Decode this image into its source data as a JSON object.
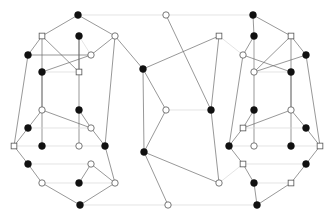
{
  "figure": {
    "type": "node-link-diagram",
    "width": 333,
    "height": 219,
    "background_color": "#ffffff",
    "edge_color_dark": "#6b6b6b",
    "edge_color_light": "#d8d8d8",
    "node_fill_black": "#111111",
    "node_fill_white": "#ffffff",
    "node_stroke": "#555555"
  },
  "legend": {
    "black_node_label": "filled vertex",
    "white_node_label": "hollow vertex",
    "square_node_label": "hollow square vertex"
  },
  "nodes": [
    {
      "id": "t1",
      "x": 78,
      "y": 15,
      "style": "black",
      "shape": "circle",
      "r": 3.4
    },
    {
      "id": "t2",
      "x": 166,
      "y": 15,
      "style": "white",
      "shape": "circle",
      "r": 3.2
    },
    {
      "id": "t3",
      "x": 253,
      "y": 15,
      "style": "black",
      "shape": "circle",
      "r": 3.4
    },
    {
      "id": "L1",
      "x": 42,
      "y": 36,
      "style": "white",
      "shape": "square",
      "r": 3.0
    },
    {
      "id": "L2",
      "x": 79,
      "y": 36,
      "style": "black",
      "shape": "circle",
      "r": 3.4
    },
    {
      "id": "L3",
      "x": 115,
      "y": 36,
      "style": "white",
      "shape": "circle",
      "r": 3.2
    },
    {
      "id": "L4",
      "x": 28,
      "y": 55,
      "style": "black",
      "shape": "circle",
      "r": 3.4
    },
    {
      "id": "L5",
      "x": 91,
      "y": 55,
      "style": "white",
      "shape": "circle",
      "r": 3.2
    },
    {
      "id": "L6",
      "x": 42,
      "y": 72,
      "style": "black",
      "shape": "circle",
      "r": 3.4
    },
    {
      "id": "L7",
      "x": 79,
      "y": 72,
      "style": "white",
      "shape": "square",
      "r": 3.0
    },
    {
      "id": "L8",
      "x": 42,
      "y": 110,
      "style": "white",
      "shape": "circle",
      "r": 3.2
    },
    {
      "id": "L9",
      "x": 79,
      "y": 110,
      "style": "black",
      "shape": "circle",
      "r": 3.4
    },
    {
      "id": "L10",
      "x": 28,
      "y": 128,
      "style": "black",
      "shape": "circle",
      "r": 3.4
    },
    {
      "id": "L11",
      "x": 91,
      "y": 128,
      "style": "white",
      "shape": "circle",
      "r": 3.2
    },
    {
      "id": "L12",
      "x": 14,
      "y": 146,
      "style": "white",
      "shape": "square",
      "r": 3.0
    },
    {
      "id": "L13",
      "x": 42,
      "y": 146,
      "style": "black",
      "shape": "circle",
      "r": 3.4
    },
    {
      "id": "L14",
      "x": 79,
      "y": 146,
      "style": "white",
      "shape": "circle",
      "r": 3.2
    },
    {
      "id": "L15",
      "x": 105,
      "y": 146,
      "style": "black",
      "shape": "circle",
      "r": 3.4
    },
    {
      "id": "L16",
      "x": 28,
      "y": 164,
      "style": "black",
      "shape": "circle",
      "r": 3.4
    },
    {
      "id": "L17",
      "x": 91,
      "y": 164,
      "style": "white",
      "shape": "circle",
      "r": 3.2
    },
    {
      "id": "L18",
      "x": 42,
      "y": 183,
      "style": "white",
      "shape": "circle",
      "r": 3.2
    },
    {
      "id": "L19",
      "x": 79,
      "y": 183,
      "style": "black",
      "shape": "circle",
      "r": 3.4
    },
    {
      "id": "L20",
      "x": 115,
      "y": 183,
      "style": "white",
      "shape": "circle",
      "r": 3.2
    },
    {
      "id": "M1",
      "x": 143,
      "y": 69,
      "style": "black",
      "shape": "circle",
      "r": 3.4
    },
    {
      "id": "M2",
      "x": 166,
      "y": 110,
      "style": "white",
      "shape": "circle",
      "r": 3.2
    },
    {
      "id": "M3",
      "x": 211,
      "y": 110,
      "style": "black",
      "shape": "circle",
      "r": 3.4
    },
    {
      "id": "M4",
      "x": 144,
      "y": 152,
      "style": "black",
      "shape": "circle",
      "r": 3.4
    },
    {
      "id": "M5",
      "x": 219,
      "y": 36,
      "style": "white",
      "shape": "square",
      "r": 3.0
    },
    {
      "id": "M6",
      "x": 219,
      "y": 183,
      "style": "white",
      "shape": "circle",
      "r": 3.2
    },
    {
      "id": "R1",
      "x": 254,
      "y": 36,
      "style": "black",
      "shape": "circle",
      "r": 3.4
    },
    {
      "id": "R2",
      "x": 291,
      "y": 36,
      "style": "white",
      "shape": "square",
      "r": 3.0
    },
    {
      "id": "R3",
      "x": 243,
      "y": 55,
      "style": "white",
      "shape": "circle",
      "r": 3.2
    },
    {
      "id": "R4",
      "x": 306,
      "y": 55,
      "style": "black",
      "shape": "circle",
      "r": 3.4
    },
    {
      "id": "R5",
      "x": 254,
      "y": 72,
      "style": "white",
      "shape": "circle",
      "r": 3.2
    },
    {
      "id": "R6",
      "x": 291,
      "y": 72,
      "style": "black",
      "shape": "circle",
      "r": 3.4
    },
    {
      "id": "R7",
      "x": 254,
      "y": 110,
      "style": "black",
      "shape": "circle",
      "r": 3.4
    },
    {
      "id": "R8",
      "x": 291,
      "y": 110,
      "style": "white",
      "shape": "circle",
      "r": 3.2
    },
    {
      "id": "R9",
      "x": 243,
      "y": 128,
      "style": "white",
      "shape": "square",
      "r": 3.0
    },
    {
      "id": "R10",
      "x": 306,
      "y": 128,
      "style": "black",
      "shape": "circle",
      "r": 3.4
    },
    {
      "id": "R11",
      "x": 229,
      "y": 146,
      "style": "black",
      "shape": "circle",
      "r": 3.4
    },
    {
      "id": "R12",
      "x": 254,
      "y": 146,
      "style": "white",
      "shape": "circle",
      "r": 3.2
    },
    {
      "id": "R13",
      "x": 291,
      "y": 146,
      "style": "black",
      "shape": "circle",
      "r": 3.4
    },
    {
      "id": "R14",
      "x": 320,
      "y": 146,
      "style": "white",
      "shape": "square",
      "r": 3.0
    },
    {
      "id": "R15",
      "x": 243,
      "y": 164,
      "style": "white",
      "shape": "square",
      "r": 3.0
    },
    {
      "id": "R16",
      "x": 306,
      "y": 164,
      "style": "black",
      "shape": "circle",
      "r": 3.4
    },
    {
      "id": "R17",
      "x": 254,
      "y": 183,
      "style": "black",
      "shape": "circle",
      "r": 3.4
    },
    {
      "id": "R18",
      "x": 291,
      "y": 183,
      "style": "white",
      "shape": "square",
      "r": 3.0
    },
    {
      "id": "b1",
      "x": 80,
      "y": 205,
      "style": "black",
      "shape": "circle",
      "r": 3.4
    },
    {
      "id": "b2",
      "x": 168,
      "y": 205,
      "style": "white",
      "shape": "circle",
      "r": 3.2
    },
    {
      "id": "b3",
      "x": 257,
      "y": 205,
      "style": "black",
      "shape": "circle",
      "r": 3.4
    }
  ],
  "edges": [
    {
      "from": "t1",
      "to": "t2",
      "tone": "light"
    },
    {
      "from": "t2",
      "to": "t3",
      "tone": "light"
    },
    {
      "from": "b1",
      "to": "b2",
      "tone": "light"
    },
    {
      "from": "b2",
      "to": "b3",
      "tone": "light"
    },
    {
      "from": "t1",
      "to": "L1",
      "tone": "dark"
    },
    {
      "from": "t1",
      "to": "L3",
      "tone": "dark"
    },
    {
      "from": "L1",
      "to": "L4",
      "tone": "dark"
    },
    {
      "from": "L1",
      "to": "L7",
      "tone": "dark"
    },
    {
      "from": "L1",
      "to": "L8",
      "tone": "dark"
    },
    {
      "from": "L2",
      "to": "L5",
      "tone": "light"
    },
    {
      "from": "L2",
      "to": "L7",
      "tone": "dark"
    },
    {
      "from": "L3",
      "to": "L5",
      "tone": "dark"
    },
    {
      "from": "L3",
      "to": "L15",
      "tone": "dark"
    },
    {
      "from": "L4",
      "to": "L5",
      "tone": "dark"
    },
    {
      "from": "L4",
      "to": "L12",
      "tone": "dark"
    },
    {
      "from": "L5",
      "to": "L6",
      "tone": "dark"
    },
    {
      "from": "L6",
      "to": "L7",
      "tone": "light"
    },
    {
      "from": "L2",
      "to": "L9",
      "tone": "dark"
    },
    {
      "from": "L6",
      "to": "L13",
      "tone": "dark"
    },
    {
      "from": "L8",
      "to": "L10",
      "tone": "dark"
    },
    {
      "from": "L8",
      "to": "L11",
      "tone": "dark"
    },
    {
      "from": "L9",
      "to": "L11",
      "tone": "dark"
    },
    {
      "from": "L9",
      "to": "L14",
      "tone": "dark"
    },
    {
      "from": "L10",
      "to": "L11",
      "tone": "light"
    },
    {
      "from": "L10",
      "to": "L12",
      "tone": "dark"
    },
    {
      "from": "L11",
      "to": "L15",
      "tone": "dark"
    },
    {
      "from": "L12",
      "to": "L13",
      "tone": "light"
    },
    {
      "from": "L13",
      "to": "L14",
      "tone": "light"
    },
    {
      "from": "L14",
      "to": "L15",
      "tone": "light"
    },
    {
      "from": "L12",
      "to": "L16",
      "tone": "dark"
    },
    {
      "from": "L16",
      "to": "L17",
      "tone": "light"
    },
    {
      "from": "L16",
      "to": "L18",
      "tone": "dark"
    },
    {
      "from": "L17",
      "to": "L19",
      "tone": "dark"
    },
    {
      "from": "L17",
      "to": "L20",
      "tone": "dark"
    },
    {
      "from": "L18",
      "to": "L19",
      "tone": "light"
    },
    {
      "from": "L19",
      "to": "L20",
      "tone": "light"
    },
    {
      "from": "L18",
      "to": "b1",
      "tone": "dark"
    },
    {
      "from": "L20",
      "to": "b1",
      "tone": "dark"
    },
    {
      "from": "L15",
      "to": "L20",
      "tone": "dark"
    },
    {
      "from": "L3",
      "to": "M1",
      "tone": "dark"
    },
    {
      "from": "M1",
      "to": "M2",
      "tone": "dark"
    },
    {
      "from": "M1",
      "to": "M4",
      "tone": "dark"
    },
    {
      "from": "M1",
      "to": "M5",
      "tone": "dark"
    },
    {
      "from": "M2",
      "to": "M3",
      "tone": "light"
    },
    {
      "from": "M2",
      "to": "M4",
      "tone": "dark"
    },
    {
      "from": "M3",
      "to": "M5",
      "tone": "dark"
    },
    {
      "from": "M3",
      "to": "M6",
      "tone": "dark"
    },
    {
      "from": "M4",
      "to": "M6",
      "tone": "dark"
    },
    {
      "from": "t2",
      "to": "M3",
      "tone": "dark"
    },
    {
      "from": "M4",
      "to": "b2",
      "tone": "dark"
    },
    {
      "from": "M5",
      "to": "R3",
      "tone": "light"
    },
    {
      "from": "M6",
      "to": "R15",
      "tone": "light"
    },
    {
      "from": "t3",
      "to": "R1",
      "tone": "dark"
    },
    {
      "from": "t3",
      "to": "R2",
      "tone": "dark"
    },
    {
      "from": "R1",
      "to": "R3",
      "tone": "dark"
    },
    {
      "from": "R1",
      "to": "R7",
      "tone": "dark"
    },
    {
      "from": "R1",
      "to": "R5",
      "tone": "light"
    },
    {
      "from": "R2",
      "to": "R4",
      "tone": "dark"
    },
    {
      "from": "R2",
      "to": "R5",
      "tone": "dark"
    },
    {
      "from": "R2",
      "to": "R8",
      "tone": "dark"
    },
    {
      "from": "R3",
      "to": "R6",
      "tone": "dark"
    },
    {
      "from": "R3",
      "to": "R11",
      "tone": "dark"
    },
    {
      "from": "R4",
      "to": "R5",
      "tone": "dark"
    },
    {
      "from": "R4",
      "to": "R14",
      "tone": "dark"
    },
    {
      "from": "R5",
      "to": "R6",
      "tone": "light"
    },
    {
      "from": "R6",
      "to": "R13",
      "tone": "dark"
    },
    {
      "from": "R7",
      "to": "R9",
      "tone": "dark"
    },
    {
      "from": "R7",
      "to": "R12",
      "tone": "dark"
    },
    {
      "from": "R8",
      "to": "R9",
      "tone": "dark"
    },
    {
      "from": "R8",
      "to": "R10",
      "tone": "dark"
    },
    {
      "from": "R9",
      "to": "R10",
      "tone": "light"
    },
    {
      "from": "R9",
      "to": "R11",
      "tone": "dark"
    },
    {
      "from": "R10",
      "to": "R14",
      "tone": "dark"
    },
    {
      "from": "R11",
      "to": "R12",
      "tone": "light"
    },
    {
      "from": "R12",
      "to": "R13",
      "tone": "light"
    },
    {
      "from": "R13",
      "to": "R14",
      "tone": "light"
    },
    {
      "from": "R14",
      "to": "R16",
      "tone": "dark"
    },
    {
      "from": "R11",
      "to": "R15",
      "tone": "dark"
    },
    {
      "from": "R15",
      "to": "R16",
      "tone": "light"
    },
    {
      "from": "R15",
      "to": "R17",
      "tone": "dark"
    },
    {
      "from": "R16",
      "to": "R18",
      "tone": "dark"
    },
    {
      "from": "R17",
      "to": "R18",
      "tone": "light"
    },
    {
      "from": "R17",
      "to": "b3",
      "tone": "dark"
    },
    {
      "from": "R18",
      "to": "b3",
      "tone": "dark"
    }
  ]
}
